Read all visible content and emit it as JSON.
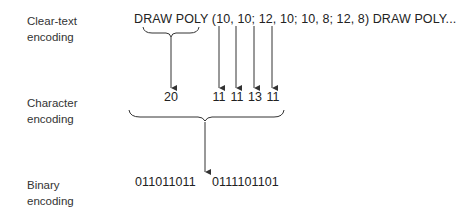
{
  "rows": {
    "clear_text": {
      "label_line1": "Clear-text",
      "label_line2": "encoding"
    },
    "character": {
      "label_line1": "Character",
      "label_line2": "encoding"
    },
    "binary": {
      "label_line1": "Binary",
      "label_line2": "encoding"
    }
  },
  "clear_text_string": "DRAW POLY (10, 10; 12, 10; 10, 8; 12, 8) DRAW POLY...",
  "character_codes": {
    "command": "20",
    "params": [
      "11",
      "11",
      "13",
      "11"
    ]
  },
  "binary_codes": {
    "first": "011011011",
    "second": "0111101101"
  }
}
